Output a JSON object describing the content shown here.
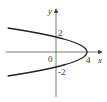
{
  "chart_data": {
    "type": "line",
    "title": "",
    "equation": "x = 4 - y^2",
    "xlabel": "x",
    "ylabel": "y",
    "origin_label": "0",
    "annotations": [
      {
        "text": "2",
        "at": [
          0,
          2
        ]
      },
      {
        "text": "-2",
        "at": [
          0,
          -2
        ]
      },
      {
        "text": "4",
        "at": [
          4,
          0
        ]
      }
    ],
    "series": [
      {
        "name": "parabola",
        "points": [
          [
            -6.2,
            -3.2
          ],
          [
            -5,
            -3
          ],
          [
            -3,
            -2.65
          ],
          [
            -1,
            -2.24
          ],
          [
            0,
            -2
          ],
          [
            2,
            -1.41
          ],
          [
            3,
            -1
          ],
          [
            3.75,
            -0.5
          ],
          [
            4,
            0
          ],
          [
            3.75,
            0.5
          ],
          [
            3,
            1
          ],
          [
            2,
            1.41
          ],
          [
            0,
            2
          ],
          [
            -1,
            2.24
          ],
          [
            -3,
            2.65
          ],
          [
            -5,
            3
          ],
          [
            -6.2,
            3.2
          ]
        ]
      }
    ],
    "xlim": [
      -6.5,
      6
    ],
    "ylim": [
      -5.5,
      6
    ],
    "grid": false,
    "colors": {
      "curve": "#222222",
      "axes": "#444444"
    }
  }
}
